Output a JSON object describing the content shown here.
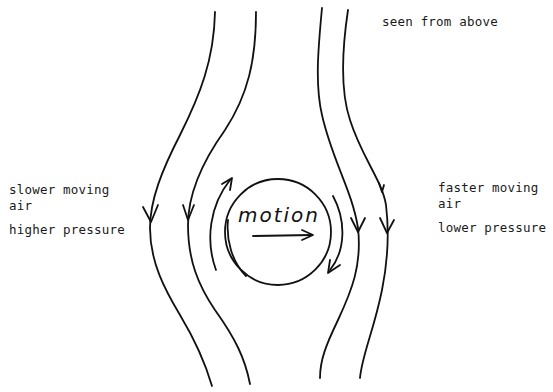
{
  "diagram": {
    "title": "seen from above",
    "left_label": {
      "line1": "slower moving",
      "line2": "air",
      "line3": "higher pressure"
    },
    "right_label": {
      "line1": "faster moving",
      "line2": "air",
      "line3": "lower pressure"
    },
    "center_label": "motion",
    "ink_color": "#111111",
    "background": "#ffffff",
    "streamlines": [
      {
        "id": "outer-left",
        "direction": "down"
      },
      {
        "id": "inner-left",
        "direction": "down"
      },
      {
        "id": "inner-right",
        "direction": "down"
      },
      {
        "id": "outer-right",
        "direction": "down"
      }
    ],
    "spin": "clockwise",
    "motion_direction": "right"
  }
}
